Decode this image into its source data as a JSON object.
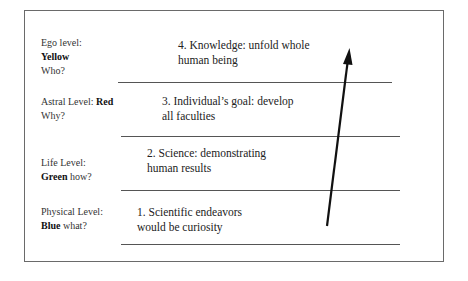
{
  "diagram": {
    "levels": [
      {
        "name_prefix": "Ego level:",
        "color_word": "Yellow",
        "question": "Who?",
        "content_line1": "4. Knowledge: unfold whole",
        "content_line2": "human being"
      },
      {
        "name_prefix": "Astral Level:",
        "color_word": "Red",
        "question": "Why?",
        "content_line1": "3. Individual’s goal: develop",
        "content_line2": "all faculties"
      },
      {
        "name_prefix": "Life Level:",
        "color_word": "Green",
        "question": "how?",
        "content_line1": "2. Science:  demonstrating",
        "content_line2": "human results"
      },
      {
        "name_prefix": "Physical Level:",
        "color_word": "Blue",
        "question": "what?",
        "content_line1": "1.  Scientific endeavors",
        "content_line2": "would be curiosity"
      }
    ],
    "arrow": {
      "direction": "up",
      "start": [
        327,
        226
      ],
      "end": [
        349,
        49
      ],
      "color": "#111111"
    }
  }
}
